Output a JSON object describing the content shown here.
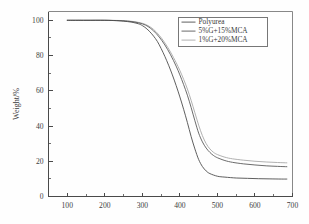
{
  "chart_data": {
    "type": "line",
    "title": "",
    "subtitle": "",
    "xlabel": "",
    "ylabel": "Weight/%",
    "xlim": [
      50,
      700
    ],
    "ylim": [
      0,
      105
    ],
    "grid": false,
    "legend_position": "top-right",
    "x_ticks": [
      100,
      200,
      300,
      400,
      500,
      600,
      700
    ],
    "x_tick_labels": [
      "100",
      "200",
      "300",
      "400",
      "500",
      "600",
      "700"
    ],
    "x_minor_ticks": [
      150,
      250,
      350,
      450,
      550,
      650
    ],
    "y_ticks": [
      0,
      20,
      40,
      60,
      80,
      100
    ],
    "y_tick_labels": [
      "0",
      "20",
      "40",
      "60",
      "80",
      "100"
    ],
    "y_minor_ticks": [
      10,
      30,
      50,
      70,
      90
    ],
    "series": [
      {
        "name": "Polyurea",
        "color": "#4d4d4d",
        "x": [
          100,
          150,
          200,
          230,
          250,
          270,
          290,
          300,
          310,
          320,
          330,
          340,
          350,
          360,
          370,
          380,
          390,
          400,
          410,
          420,
          430,
          440,
          450,
          460,
          470,
          480,
          500,
          520,
          550,
          580,
          610,
          640,
          670,
          685
        ],
        "y": [
          100,
          100,
          100,
          99.8,
          99.5,
          99.0,
          98.0,
          97.0,
          95.5,
          93.5,
          91.0,
          88.0,
          84.0,
          79.5,
          74.5,
          69.0,
          63.0,
          56.5,
          49.5,
          42.0,
          34.0,
          27.0,
          21.0,
          17.0,
          14.5,
          13.0,
          11.5,
          11.0,
          10.5,
          10.3,
          10.1,
          10.0,
          9.9,
          9.9
        ]
      },
      {
        "name": "5%G+15%MCA",
        "color": "#5a5a5a",
        "x": [
          100,
          150,
          200,
          240,
          260,
          280,
          300,
          315,
          330,
          345,
          360,
          375,
          390,
          400,
          410,
          420,
          430,
          440,
          450,
          460,
          470,
          480,
          490,
          500,
          520,
          540,
          570,
          600,
          630,
          660,
          685
        ],
        "y": [
          100,
          100,
          100,
          99.8,
          99.5,
          99.0,
          98.0,
          96.5,
          94.0,
          90.5,
          86.0,
          80.5,
          74.0,
          69.0,
          63.5,
          57.5,
          50.5,
          43.0,
          36.0,
          31.0,
          27.5,
          25.0,
          23.2,
          22.0,
          20.4,
          19.4,
          18.5,
          17.9,
          17.4,
          17.1,
          16.9
        ]
      },
      {
        "name": "1%G+20%MCA",
        "color": "#a8a8a8",
        "x": [
          100,
          150,
          200,
          240,
          260,
          280,
          300,
          315,
          330,
          345,
          360,
          375,
          390,
          400,
          410,
          420,
          430,
          440,
          450,
          460,
          470,
          480,
          490,
          500,
          520,
          540,
          570,
          600,
          630,
          660,
          685
        ],
        "y": [
          100,
          100,
          100,
          99.9,
          99.7,
          99.2,
          98.3,
          97.0,
          94.8,
          91.5,
          87.2,
          82.0,
          76.0,
          71.5,
          66.5,
          61.0,
          54.5,
          47.5,
          40.5,
          34.5,
          30.0,
          27.0,
          25.0,
          23.8,
          22.3,
          21.4,
          20.6,
          20.0,
          19.6,
          19.3,
          19.1
        ]
      }
    ]
  },
  "legend": {
    "items": [
      {
        "label": "Polyurea"
      },
      {
        "label": "5%G+15%MCA"
      },
      {
        "label": "1%G+20%MCA"
      }
    ]
  },
  "axes": {
    "y_title": "Weight/%",
    "x_title": ""
  }
}
